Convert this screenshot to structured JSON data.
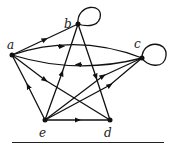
{
  "diagram": {
    "type": "directed-graph",
    "nodes": [
      {
        "id": "a",
        "label": "a",
        "x": 12,
        "y": 55
      },
      {
        "id": "b",
        "label": "b",
        "x": 78,
        "y": 24
      },
      {
        "id": "c",
        "label": "c",
        "x": 142,
        "y": 58
      },
      {
        "id": "d",
        "label": "d",
        "x": 110,
        "y": 120
      },
      {
        "id": "e",
        "label": "e",
        "x": 45,
        "y": 120
      }
    ],
    "edges": [
      {
        "from": "a",
        "to": "b"
      },
      {
        "from": "a",
        "to": "c"
      },
      {
        "from": "c",
        "to": "a"
      },
      {
        "from": "a",
        "to": "d"
      },
      {
        "from": "e",
        "to": "a"
      },
      {
        "from": "e",
        "to": "b"
      },
      {
        "from": "b",
        "to": "d"
      },
      {
        "from": "e",
        "to": "c"
      },
      {
        "from": "d",
        "to": "c"
      },
      {
        "from": "e",
        "to": "d"
      },
      {
        "from": "b",
        "to": "b"
      },
      {
        "from": "c",
        "to": "c"
      }
    ],
    "colors": {
      "stroke": "#111111",
      "background": "#ffffff"
    }
  }
}
